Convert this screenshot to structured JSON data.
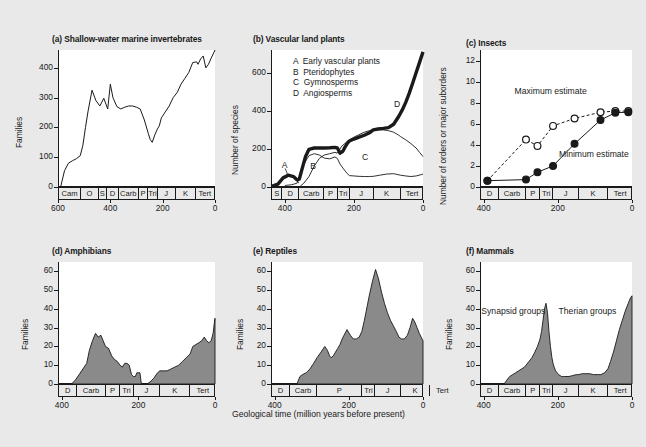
{
  "figure": {
    "background": "#e9e9e9",
    "plot_background": "#ffffff",
    "line_color": "#1a1a1a",
    "fill_color": "#8a8a8a",
    "x_axis_caption": "Geological time (million years before present)"
  },
  "chart_data": [
    {
      "type": "line",
      "panel": "a",
      "title": "(a) Shallow-water marine invertebrates",
      "ylabel": "Families",
      "xlabel": "",
      "xlim": [
        600,
        0
      ],
      "ylim": [
        0,
        460
      ],
      "yticks": [
        0,
        100,
        200,
        300,
        400
      ],
      "xticks": [
        600,
        400,
        200,
        0
      ],
      "grid": false,
      "periods": [
        {
          "label": "Cam",
          "start": 590,
          "end": 505
        },
        {
          "label": "O",
          "start": 505,
          "end": 438
        },
        {
          "label": "S",
          "start": 438,
          "end": 408
        },
        {
          "label": "D",
          "start": 408,
          "end": 360
        },
        {
          "label": "Carb",
          "start": 360,
          "end": 286
        },
        {
          "label": "P",
          "start": 286,
          "end": 248
        },
        {
          "label": "Tri",
          "start": 248,
          "end": 213
        },
        {
          "label": "J",
          "start": 213,
          "end": 144
        },
        {
          "label": "K",
          "start": 144,
          "end": 65
        },
        {
          "label": "Tert",
          "start": 65,
          "end": 0
        }
      ],
      "x": [
        590,
        575,
        560,
        545,
        530,
        515,
        505,
        495,
        485,
        470,
        455,
        440,
        425,
        410,
        400,
        390,
        375,
        360,
        345,
        330,
        315,
        300,
        286,
        270,
        255,
        248,
        240,
        230,
        220,
        213,
        205,
        190,
        175,
        160,
        144,
        130,
        115,
        100,
        85,
        70,
        65,
        55,
        45,
        35,
        25,
        15,
        5,
        0
      ],
      "y": [
        0,
        55,
        80,
        88,
        95,
        105,
        140,
        200,
        255,
        325,
        290,
        272,
        298,
        262,
        345,
        300,
        270,
        262,
        268,
        272,
        272,
        268,
        262,
        225,
        180,
        160,
        150,
        175,
        195,
        205,
        232,
        252,
        272,
        300,
        318,
        345,
        365,
        385,
        418,
        420,
        412,
        430,
        440,
        400,
        412,
        432,
        450,
        460
      ]
    },
    {
      "type": "line",
      "panel": "b",
      "title": "(b) Vascular land plants",
      "ylabel": "Number of species",
      "xlabel": "",
      "xlim": [
        440,
        0
      ],
      "ylim": [
        0,
        720
      ],
      "yticks": [
        0,
        200,
        400,
        600
      ],
      "xticks": [
        400,
        200,
        0
      ],
      "grid": false,
      "legend": [
        {
          "key": "A",
          "label": "Early vascular plants"
        },
        {
          "key": "B",
          "label": "Pteridophytes"
        },
        {
          "key": "C",
          "label": "Gymnosperms"
        },
        {
          "key": "D",
          "label": "Angiosperms"
        }
      ],
      "periods": [
        {
          "label": "S",
          "start": 438,
          "end": 408
        },
        {
          "label": "D",
          "start": 408,
          "end": 360
        },
        {
          "label": "Carb",
          "start": 360,
          "end": 286
        },
        {
          "label": "P",
          "start": 286,
          "end": 248
        },
        {
          "label": "Tri",
          "start": 248,
          "end": 213
        },
        {
          "label": "J",
          "start": 213,
          "end": 144
        },
        {
          "label": "K",
          "start": 144,
          "end": 65
        },
        {
          "label": "Tert",
          "start": 65,
          "end": 0
        }
      ],
      "series": [
        {
          "name": "A Early vascular plants",
          "x": [
            438,
            420,
            405,
            390,
            375,
            365,
            360
          ],
          "y": [
            3,
            15,
            48,
            62,
            55,
            35,
            20
          ]
        },
        {
          "name": "B Pteridophytes",
          "x": [
            400,
            380,
            365,
            355,
            345,
            330,
            315,
            300,
            286,
            270,
            255,
            248,
            240,
            230,
            220,
            213,
            200,
            185,
            170,
            155,
            144,
            125,
            105,
            85,
            65,
            50,
            35,
            20,
            5,
            0
          ],
          "y": [
            8,
            12,
            20,
            60,
            120,
            165,
            175,
            168,
            152,
            148,
            158,
            150,
            120,
            95,
            72,
            60,
            58,
            56,
            55,
            55,
            56,
            62,
            68,
            70,
            62,
            58,
            55,
            58,
            65,
            68
          ]
        },
        {
          "name": "C Gymnosperms",
          "x": [
            355,
            345,
            330,
            315,
            300,
            286,
            270,
            255,
            248,
            235,
            220,
            213,
            200,
            185,
            170,
            155,
            144,
            130,
            115,
            100,
            85,
            70,
            65,
            50,
            35,
            20,
            10,
            0
          ],
          "y": [
            5,
            20,
            55,
            110,
            150,
            168,
            175,
            182,
            178,
            215,
            238,
            248,
            262,
            275,
            288,
            296,
            300,
            302,
            300,
            296,
            288,
            272,
            265,
            248,
            228,
            205,
            182,
            160
          ]
        },
        {
          "name": "D Angiosperms (total curve, heavy line)",
          "x": [
            438,
            420,
            405,
            390,
            375,
            365,
            358,
            350,
            340,
            330,
            315,
            300,
            286,
            270,
            255,
            248,
            240,
            232,
            225,
            218,
            213,
            200,
            185,
            170,
            155,
            144,
            130,
            115,
            100,
            85,
            70,
            60,
            50,
            40,
            30,
            20,
            10,
            0
          ],
          "y": [
            3,
            15,
            48,
            62,
            55,
            38,
            42,
            95,
            160,
            198,
            205,
            205,
            205,
            206,
            208,
            205,
            178,
            188,
            212,
            232,
            242,
            252,
            262,
            272,
            285,
            300,
            305,
            308,
            312,
            330,
            372,
            405,
            445,
            492,
            545,
            600,
            655,
            710
          ]
        }
      ]
    },
    {
      "type": "scatter",
      "panel": "c",
      "title": "(c) Insects",
      "ylabel": "Number of orders or major suborders",
      "xlabel": "",
      "xlim": [
        410,
        0
      ],
      "ylim": [
        0,
        13
      ],
      "yticks": [
        0,
        2,
        4,
        6,
        8,
        10,
        12
      ],
      "xticks": [
        400,
        200,
        0
      ],
      "grid": false,
      "periods": [
        {
          "label": "D",
          "start": 408,
          "end": 360
        },
        {
          "label": "Carb",
          "start": 360,
          "end": 286
        },
        {
          "label": "P",
          "start": 286,
          "end": 248
        },
        {
          "label": "Tri",
          "start": 248,
          "end": 213
        },
        {
          "label": "J",
          "start": 213,
          "end": 144
        },
        {
          "label": "K",
          "start": 144,
          "end": 65
        },
        {
          "label": "Tert",
          "start": 65,
          "end": 0
        }
      ],
      "series": [
        {
          "name": "Maximum estimate",
          "style": "dashed-open-circle",
          "x": [
            390,
            286,
            255,
            213,
            155,
            85,
            45,
            10
          ],
          "y": [
            0.6,
            4.5,
            3.9,
            5.8,
            6.5,
            7.1,
            7.2,
            7.2
          ]
        },
        {
          "name": "Minimum estimate",
          "style": "solid-filled-circle",
          "x": [
            390,
            286,
            255,
            213,
            155,
            85,
            45,
            10
          ],
          "y": [
            0.6,
            0.7,
            1.4,
            2.0,
            4.1,
            6.35,
            7.05,
            7.1
          ]
        }
      ],
      "annotations": [
        {
          "text": "Maximum\nestimate",
          "x": 225,
          "y": 8.6
        },
        {
          "text": "Minimum\nestimate",
          "x": 105,
          "y": 2.7
        }
      ]
    },
    {
      "type": "area",
      "panel": "d",
      "title": "(d) Amphibians",
      "ylabel": "Families",
      "xlabel": "",
      "xlim": [
        410,
        0
      ],
      "ylim": [
        0,
        65
      ],
      "yticks": [
        0,
        10,
        20,
        30,
        40,
        50,
        60
      ],
      "xticks": [
        400,
        200,
        0
      ],
      "grid": false,
      "periods": [
        {
          "label": "D",
          "start": 408,
          "end": 360
        },
        {
          "label": "Carb",
          "start": 360,
          "end": 286
        },
        {
          "label": "P",
          "start": 286,
          "end": 248
        },
        {
          "label": "Tri",
          "start": 248,
          "end": 213
        },
        {
          "label": "J",
          "start": 213,
          "end": 144
        },
        {
          "label": "K",
          "start": 144,
          "end": 65
        },
        {
          "label": "Tert",
          "start": 65,
          "end": 0
        }
      ],
      "x": [
        375,
        365,
        355,
        345,
        335,
        328,
        320,
        312,
        305,
        298,
        292,
        286,
        278,
        270,
        262,
        255,
        248,
        242,
        236,
        230,
        224,
        218,
        213,
        208,
        204,
        200,
        196,
        193,
        190,
        186,
        182,
        178,
        170,
        160,
        150,
        144,
        135,
        125,
        115,
        105,
        95,
        85,
        75,
        65,
        58,
        50,
        42,
        35,
        28,
        22,
        16,
        10,
        5,
        2,
        0
      ],
      "y": [
        0,
        2,
        5,
        8,
        11,
        18,
        23,
        27,
        25,
        26,
        23,
        20,
        19,
        15,
        13,
        12,
        10,
        9,
        11,
        11,
        10,
        5,
        4,
        4,
        6,
        6,
        6,
        1,
        0,
        0,
        0,
        0,
        1,
        3,
        6,
        7,
        7,
        7,
        8,
        9,
        10,
        12,
        14,
        16,
        20,
        21,
        22,
        23,
        25,
        23,
        22,
        23,
        27,
        32,
        35
      ]
    },
    {
      "type": "area",
      "panel": "e",
      "title": "(e) Reptiles",
      "ylabel": "Families",
      "xlabel": "",
      "xlim": [
        410,
        0
      ],
      "ylim": [
        0,
        65
      ],
      "yticks": [
        0,
        10,
        20,
        30,
        40,
        50,
        60
      ],
      "xticks": [
        400,
        200,
        0
      ],
      "grid": false,
      "periods": [
        {
          "label": "D",
          "start": 408,
          "end": 360
        },
        {
          "label": "Carb",
          "start": 360,
          "end": 286
        },
        {
          "label": "P",
          "start": 408,
          "end": 286
        },
        {
          "label": "Tri",
          "start": 248,
          "end": 213
        },
        {
          "label": "J",
          "start": 213,
          "end": 144
        },
        {
          "label": "K",
          "start": 144,
          "end": 65
        },
        {
          "label": "Tert",
          "start": 65,
          "end": 0
        }
      ],
      "x": [
        340,
        332,
        325,
        315,
        305,
        295,
        286,
        275,
        265,
        258,
        252,
        248,
        242,
        236,
        230,
        224,
        218,
        213,
        205,
        196,
        188,
        180,
        172,
        165,
        158,
        150,
        144,
        136,
        128,
        120,
        112,
        104,
        96,
        88,
        80,
        72,
        65,
        58,
        50,
        42,
        35,
        28,
        22,
        16,
        10,
        5,
        0
      ],
      "y": [
        0,
        4,
        5,
        6,
        8,
        11,
        14,
        17,
        20,
        18,
        15,
        14,
        15,
        17,
        19,
        21,
        24,
        26,
        29,
        26,
        24,
        24,
        25,
        28,
        34,
        42,
        48,
        55,
        61,
        56,
        49,
        43,
        38,
        34,
        31,
        28,
        25,
        24,
        24,
        26,
        30,
        35,
        33,
        30,
        27,
        25,
        23
      ]
    },
    {
      "type": "area",
      "panel": "f",
      "title": "(f) Mammals",
      "ylabel": "Families",
      "xlabel": "",
      "xlim": [
        410,
        0
      ],
      "ylim": [
        0,
        65
      ],
      "yticks": [
        0,
        10,
        20,
        30,
        40,
        50,
        60
      ],
      "xticks": [
        400,
        200,
        0
      ],
      "grid": false,
      "periods": [
        {
          "label": "D",
          "start": 408,
          "end": 360
        },
        {
          "label": "Carb",
          "start": 360,
          "end": 286
        },
        {
          "label": "P",
          "start": 286,
          "end": 248
        },
        {
          "label": "Tri",
          "start": 248,
          "end": 213
        },
        {
          "label": "J",
          "start": 213,
          "end": 144
        },
        {
          "label": "K",
          "start": 144,
          "end": 65
        },
        {
          "label": "Tert",
          "start": 65,
          "end": 0
        }
      ],
      "annotations": [
        {
          "text": "Synapsid\ngroups",
          "x": 320,
          "y": 36
        },
        {
          "text": "Therian\ngroups",
          "x": 120,
          "y": 36
        }
      ],
      "x": [
        345,
        338,
        330,
        322,
        314,
        306,
        298,
        290,
        286,
        278,
        270,
        262,
        255,
        248,
        244,
        240,
        236,
        232,
        228,
        224,
        220,
        216,
        213,
        210,
        206,
        202,
        198,
        194,
        190,
        185,
        178,
        170,
        160,
        150,
        144,
        134,
        124,
        114,
        104,
        94,
        84,
        74,
        65,
        58,
        50,
        42,
        34,
        26,
        18,
        10,
        4,
        0
      ],
      "y": [
        0,
        2,
        4,
        5,
        6,
        7,
        8,
        9,
        10,
        12,
        14,
        17,
        20,
        24,
        28,
        34,
        40,
        43,
        38,
        28,
        20,
        14,
        11,
        9,
        7,
        6,
        5,
        4.5,
        4,
        4,
        4,
        4,
        4.5,
        5,
        5,
        5.5,
        5.5,
        5.5,
        5,
        5,
        5,
        6,
        8,
        12,
        17,
        23,
        29,
        34,
        39,
        43,
        46,
        47
      ]
    }
  ]
}
